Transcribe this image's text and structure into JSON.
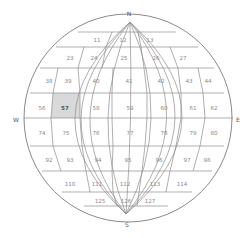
{
  "compass": {
    "north": "N",
    "south": "S",
    "west": "W",
    "east": "E"
  },
  "colors": {
    "selected_fill": "#d9d9d9",
    "line": "#8c8c8c",
    "label": "#8a8a8a"
  },
  "selected_cell": "57",
  "rows": [
    {
      "cells": [
        {
          "label": "11",
          "x": 97,
          "y": 40
        },
        {
          "label": "12",
          "x": 123,
          "y": 40
        },
        {
          "label": "13",
          "x": 150,
          "y": 40
        }
      ]
    },
    {
      "cells": [
        {
          "label": "23",
          "x": 70,
          "y": 58
        },
        {
          "label": "24",
          "x": 94,
          "y": 58
        },
        {
          "label": "25",
          "x": 124,
          "y": 58
        },
        {
          "label": "26",
          "x": 156,
          "y": 58
        },
        {
          "label": "27",
          "x": 183,
          "y": 58
        }
      ]
    },
    {
      "cells": [
        {
          "label": "38",
          "x": 49,
          "y": 81
        },
        {
          "label": "39",
          "x": 68,
          "y": 81
        },
        {
          "label": "40",
          "x": 96,
          "y": 81
        },
        {
          "label": "41",
          "x": 129,
          "y": 81
        },
        {
          "label": "42",
          "x": 161,
          "y": 81
        },
        {
          "label": "43",
          "x": 189,
          "y": 81
        },
        {
          "label": "44",
          "x": 208,
          "y": 81
        }
      ]
    },
    {
      "cells": [
        {
          "label": "56",
          "x": 42,
          "y": 108
        },
        {
          "label": "57",
          "x": 65,
          "y": 108,
          "selected": true
        },
        {
          "label": "58",
          "x": 96,
          "y": 108
        },
        {
          "label": "59",
          "x": 130,
          "y": 108
        },
        {
          "label": "60",
          "x": 164,
          "y": 108
        },
        {
          "label": "61",
          "x": 193,
          "y": 108
        },
        {
          "label": "62",
          "x": 214,
          "y": 108
        }
      ]
    },
    {
      "cells": [
        {
          "label": "74",
          "x": 42,
          "y": 133
        },
        {
          "label": "75",
          "x": 66,
          "y": 133
        },
        {
          "label": "76",
          "x": 96,
          "y": 133
        },
        {
          "label": "77",
          "x": 130,
          "y": 133
        },
        {
          "label": "78",
          "x": 164,
          "y": 133
        },
        {
          "label": "79",
          "x": 193,
          "y": 133
        },
        {
          "label": "80",
          "x": 214,
          "y": 133
        }
      ]
    },
    {
      "cells": [
        {
          "label": "92",
          "x": 49,
          "y": 160
        },
        {
          "label": "93",
          "x": 70,
          "y": 160
        },
        {
          "label": "94",
          "x": 98,
          "y": 160
        },
        {
          "label": "95",
          "x": 128,
          "y": 160
        },
        {
          "label": "96",
          "x": 159,
          "y": 160
        },
        {
          "label": "97",
          "x": 187,
          "y": 160
        },
        {
          "label": "98",
          "x": 207,
          "y": 160
        }
      ]
    },
    {
      "cells": [
        {
          "label": "110",
          "x": 70,
          "y": 184
        },
        {
          "label": "111",
          "x": 97,
          "y": 184
        },
        {
          "label": "112",
          "x": 125,
          "y": 184
        },
        {
          "label": "113",
          "x": 155,
          "y": 184
        },
        {
          "label": "114",
          "x": 182,
          "y": 184
        }
      ]
    },
    {
      "cells": [
        {
          "label": "125",
          "x": 100,
          "y": 201
        },
        {
          "label": "126",
          "x": 126,
          "y": 201
        },
        {
          "label": "127",
          "x": 150,
          "y": 201
        }
      ]
    }
  ]
}
